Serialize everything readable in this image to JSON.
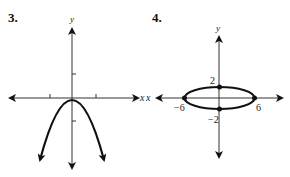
{
  "problems": [
    {
      "number": "3.",
      "axis_labels": {
        "x": "x",
        "y": "y"
      },
      "curve": "downward-opening parabola with vertex at origin",
      "tick_count_x": 2,
      "tick_count_y": 2
    },
    {
      "number": "4.",
      "axis_labels": {
        "x": "x",
        "y": "y"
      },
      "curve": "ellipse centered at origin",
      "points": [
        {
          "label": "2",
          "x": 0,
          "y": 2
        },
        {
          "label": "-2",
          "x": 0,
          "y": -2
        },
        {
          "label": "-6",
          "x": -6,
          "y": 0
        },
        {
          "label": "6",
          "x": 6,
          "y": 0
        }
      ]
    }
  ],
  "labels": {
    "p3_num": "3.",
    "p3_x": "x",
    "p3_y": "y",
    "p4_num": "4.",
    "p4_x": "x",
    "p4_y": "y",
    "p4_top": "2",
    "p4_bottom": "−2",
    "p4_left": "−6",
    "p4_right": "6"
  }
}
